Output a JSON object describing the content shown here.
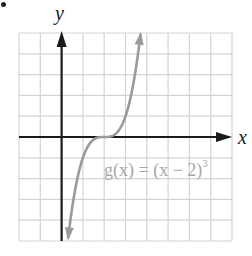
{
  "chart_data": {
    "type": "line",
    "title": "",
    "xlabel": "x",
    "ylabel": "y",
    "xlim": [
      -2,
      8
    ],
    "ylim": [
      -5,
      5
    ],
    "grid": true,
    "grid_step": 1,
    "series": [
      {
        "name": "g(x) = (x − 2)^3",
        "function": "(x-2)^3",
        "inflection_point": [
          2,
          0
        ],
        "x": [
          0.31,
          0.5,
          1,
          1.5,
          2,
          2.5,
          3,
          3.5,
          3.7
        ],
        "values": [
          -4.83,
          -3.375,
          -1,
          -0.125,
          0,
          0.125,
          1,
          3.375,
          4.91
        ],
        "color": "#999999",
        "arrows_at_ends": true
      }
    ],
    "annotations": [
      {
        "text": "g(x) = (x − 2)³",
        "position": [
          2,
          -1.5
        ]
      }
    ]
  },
  "labels": {
    "x_axis": "x",
    "y_axis": "y",
    "function_main": "g(x) = (x − 2)",
    "function_exp": "3"
  },
  "colors": {
    "grid": "#d4d4d4",
    "axis": "#1a1a1a",
    "curve": "#9a9a9a",
    "label": "#a8a8a8"
  }
}
